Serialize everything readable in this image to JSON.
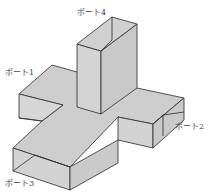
{
  "diagram": {
    "colors": {
      "face": "#cfcfcf",
      "face_dark": "#bdbdbd",
      "face_light": "#d9d9d9",
      "edge": "#2a2a2a",
      "background": "#ffffff"
    },
    "labels": [
      {
        "id": "port4",
        "text": "ポート4",
        "x": 77,
        "y": 9
      },
      {
        "id": "port1",
        "text": "ポート1",
        "x": 5,
        "y": 69
      },
      {
        "id": "port2",
        "text": "ポート2",
        "x": 175,
        "y": 123
      },
      {
        "id": "port3",
        "text": "ポート3",
        "x": 5,
        "y": 180
      }
    ]
  }
}
